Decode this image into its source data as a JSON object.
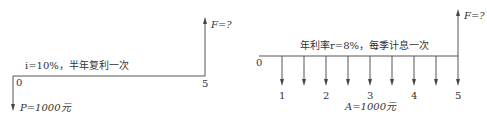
{
  "diagrams": [
    {
      "id": "left",
      "rate_text": "i=10%，半年复利一次",
      "start_label": "0",
      "end_label": "5",
      "present_value": "P=1000元",
      "future_value": "F=?"
    },
    {
      "id": "right",
      "rate_text": "年利率r=8%，每季计息一次",
      "start_label": "0",
      "period_labels": [
        "1",
        "2",
        "3",
        "4",
        "5"
      ],
      "annuity": "A=1000元",
      "future_value": "F=?",
      "payment_count": 9
    }
  ],
  "colors": {
    "line": "#555555",
    "text": "#333333",
    "background": "#ffffff"
  }
}
